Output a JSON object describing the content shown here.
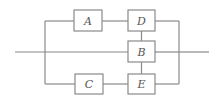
{
  "diagram": {
    "type": "reliability-block-diagram",
    "blocks": [
      {
        "id": "A",
        "label": "A"
      },
      {
        "id": "D",
        "label": "D"
      },
      {
        "id": "B",
        "label": "B"
      },
      {
        "id": "C",
        "label": "C"
      },
      {
        "id": "E",
        "label": "E"
      }
    ],
    "connections": [
      [
        "input",
        "A"
      ],
      [
        "A",
        "D"
      ],
      [
        "D",
        "output"
      ],
      [
        "input",
        "B"
      ],
      [
        "B",
        "output"
      ],
      [
        "input",
        "C"
      ],
      [
        "C",
        "E"
      ],
      [
        "E",
        "output"
      ],
      [
        "D",
        "B"
      ],
      [
        "B",
        "E"
      ]
    ],
    "colors": {
      "line": "#8a8a8a",
      "text": "#555555",
      "background": "#ffffff"
    }
  }
}
